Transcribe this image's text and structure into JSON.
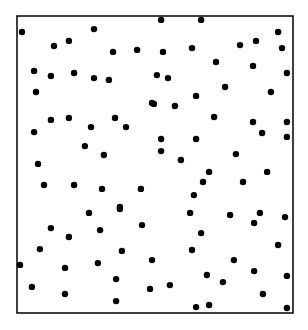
{
  "chart_data": {
    "type": "scatter",
    "title": "",
    "xlabel": "",
    "ylabel": "",
    "xlim": [
      0,
      100
    ],
    "ylim": [
      0,
      100
    ],
    "grid": false,
    "legend": "none",
    "colors": {
      "point": "#000000",
      "frame": "#000000",
      "background": "#ffffff"
    },
    "series": [
      {
        "name": "points",
        "points": [
          [
            1.8,
            94.6
          ],
          [
            13.4,
            89.9
          ],
          [
            18.8,
            91.6
          ],
          [
            27.9,
            95.6
          ],
          [
            34.8,
            87.9
          ],
          [
            43.5,
            88.6
          ],
          [
            6.2,
            81.5
          ],
          [
            12.3,
            79.8
          ],
          [
            20.7,
            80.8
          ],
          [
            27.9,
            79.1
          ],
          [
            33.3,
            78.5
          ],
          [
            6.9,
            74.4
          ],
          [
            48.9,
            70.7
          ],
          [
            52.2,
            98.7
          ],
          [
            66.7,
            98.7
          ],
          [
            52.9,
            87.9
          ],
          [
            63.4,
            89.2
          ],
          [
            72.1,
            84.5
          ],
          [
            80.8,
            90.2
          ],
          [
            86.6,
            91.6
          ],
          [
            94.6,
            94.6
          ],
          [
            96.0,
            89.2
          ],
          [
            85.5,
            83.2
          ],
          [
            97.8,
            80.8
          ],
          [
            50.7,
            80.1
          ],
          [
            54.7,
            79.1
          ],
          [
            75.4,
            76.1
          ],
          [
            92.0,
            74.4
          ],
          [
            64.9,
            73.1
          ],
          [
            49.6,
            70.4
          ],
          [
            57.2,
            69.7
          ],
          [
            12.3,
            65.0
          ],
          [
            18.8,
            65.7
          ],
          [
            6.2,
            60.9
          ],
          [
            26.8,
            62.6
          ],
          [
            35.5,
            65.7
          ],
          [
            39.5,
            62.6
          ],
          [
            24.6,
            56.2
          ],
          [
            31.5,
            53.2
          ],
          [
            7.6,
            50.2
          ],
          [
            9.8,
            43.1
          ],
          [
            20.7,
            43.1
          ],
          [
            30.8,
            41.8
          ],
          [
            44.9,
            41.8
          ],
          [
            37.3,
            35.7
          ],
          [
            71.4,
            66.0
          ],
          [
            85.5,
            64.3
          ],
          [
            97.8,
            64.3
          ],
          [
            88.8,
            60.6
          ],
          [
            97.8,
            59.3
          ],
          [
            52.2,
            58.6
          ],
          [
            64.9,
            58.6
          ],
          [
            52.2,
            54.5
          ],
          [
            59.4,
            51.5
          ],
          [
            79.3,
            53.5
          ],
          [
            69.6,
            47.5
          ],
          [
            90.6,
            47.5
          ],
          [
            67.4,
            44.1
          ],
          [
            81.9,
            44.1
          ],
          [
            64.1,
            39.7
          ],
          [
            26.1,
            33.7
          ],
          [
            37.3,
            35.0
          ],
          [
            12.3,
            28.6
          ],
          [
            18.8,
            25.6
          ],
          [
            30.1,
            27.9
          ],
          [
            45.3,
            29.6
          ],
          [
            8.3,
            21.5
          ],
          [
            38.0,
            20.9
          ],
          [
            1.1,
            16.2
          ],
          [
            17.4,
            15.2
          ],
          [
            29.3,
            16.8
          ],
          [
            35.9,
            11.4
          ],
          [
            48.9,
            17.8
          ],
          [
            5.4,
            8.8
          ],
          [
            17.4,
            6.4
          ],
          [
            35.9,
            4.0
          ],
          [
            48.2,
            8.1
          ],
          [
            62.7,
            33.7
          ],
          [
            77.2,
            33.0
          ],
          [
            88.0,
            33.7
          ],
          [
            97.1,
            32.3
          ],
          [
            85.9,
            30.3
          ],
          [
            66.7,
            26.9
          ],
          [
            94.6,
            22.9
          ],
          [
            63.4,
            21.2
          ],
          [
            78.6,
            17.8
          ],
          [
            85.9,
            14.1
          ],
          [
            97.8,
            12.5
          ],
          [
            68.8,
            12.8
          ],
          [
            74.6,
            10.4
          ],
          [
            55.4,
            9.4
          ],
          [
            89.1,
            6.4
          ],
          [
            64.9,
            2.0
          ],
          [
            69.6,
            2.7
          ],
          [
            97.8,
            1.7
          ]
        ]
      }
    ]
  }
}
